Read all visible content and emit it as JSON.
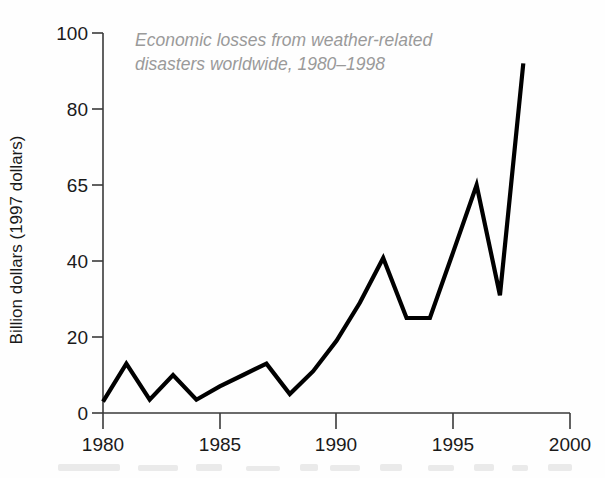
{
  "chart_data": {
    "type": "line",
    "title_line1": "Economic losses from weather-related",
    "title_line2": "disasters worldwide, 1980–1998",
    "xlabel": "",
    "ylabel": "Billion dollars (1997 dollars)",
    "xlim": [
      1980,
      2000
    ],
    "ylim": [
      0,
      100
    ],
    "x_ticks": [
      1980,
      1985,
      1990,
      1995,
      2000
    ],
    "x_tick_labels": [
      "1980",
      "1985",
      "1990",
      "1995",
      "2000"
    ],
    "y_ticks": [
      0,
      20,
      40,
      65,
      80,
      100
    ],
    "y_tick_labels": [
      "0",
      "20",
      "40",
      "65",
      "80",
      "100"
    ],
    "y_axis_note": "y tick values are evenly spaced on the drawing but non-uniform in value (0,20,40,65,80,100)",
    "grid": false,
    "legend": false,
    "line_color": "#000000",
    "title_color": "#9a9a9a",
    "axis_color": "#3a3a3a",
    "x": [
      1980,
      1981,
      1982,
      1983,
      1984,
      1985,
      1986,
      1987,
      1988,
      1989,
      1990,
      1991,
      1992,
      1993,
      1994,
      1995,
      1996,
      1997,
      1998
    ],
    "values": [
      3,
      13,
      3.5,
      10,
      3.5,
      7,
      10,
      13,
      5,
      11,
      19,
      29,
      41,
      25,
      25,
      43,
      65,
      31,
      92
    ],
    "series": [
      {
        "name": "Economic losses",
        "values": [
          3,
          13,
          3.5,
          10,
          3.5,
          7,
          10,
          13,
          5,
          11,
          19,
          29,
          41,
          25,
          25,
          43,
          65,
          31,
          92
        ]
      }
    ]
  }
}
